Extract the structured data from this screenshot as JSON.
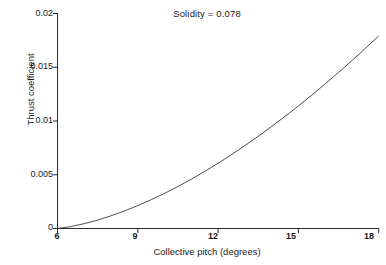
{
  "figure": {
    "title": "Solidity = 0.078",
    "background_color": "#ffffff",
    "axis_color": "#2b2b2b",
    "curve_color": "#3a3a3a"
  },
  "axes": {
    "xlabel": "Collective pitch (degrees)",
    "ylabel": "Thrust coefficient",
    "x_ticks": [
      "6",
      "9",
      "12",
      "15",
      "18"
    ],
    "y_ticks": [
      "0",
      "0.005",
      "0.01",
      "0.015",
      "0.02"
    ]
  },
  "chart_data": {
    "type": "line",
    "title": "Solidity = 0.078",
    "subtitle": "",
    "xlabel": "Collective pitch (degrees)",
    "ylabel": "Thrust coefficient",
    "xlim": [
      6,
      18
    ],
    "ylim": [
      0,
      0.02
    ],
    "xticks": [
      6,
      9,
      12,
      15,
      18
    ],
    "yticks": [
      0,
      0.005,
      0.01,
      0.015,
      0.02
    ],
    "grid": false,
    "legend": null,
    "annotations": [
      "Solidity = 0.078"
    ],
    "series": [
      {
        "name": "Thrust coefficient",
        "x": [
          6,
          6.5,
          7,
          7.5,
          8,
          8.5,
          9,
          9.5,
          10,
          10.5,
          11,
          11.5,
          12,
          12.5,
          13,
          13.5,
          14,
          14.5,
          15,
          15.5,
          16,
          16.5,
          17,
          17.5,
          18
        ],
        "values": [
          0.0,
          0.00018,
          0.00045,
          0.00078,
          0.00118,
          0.00163,
          0.00213,
          0.00268,
          0.00327,
          0.00391,
          0.00459,
          0.00531,
          0.00607,
          0.00687,
          0.00771,
          0.00858,
          0.00949,
          0.01043,
          0.0114,
          0.01241,
          0.01345,
          0.01452,
          0.01562,
          0.01675,
          0.01791
        ]
      }
    ]
  }
}
